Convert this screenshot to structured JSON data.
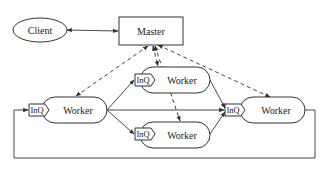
{
  "diagram": {
    "type": "master-worker architecture",
    "nodes": {
      "client": {
        "label": "Client"
      },
      "master": {
        "label": "Master"
      },
      "worker_left": {
        "label": "Worker",
        "queue": "InQ"
      },
      "worker_top": {
        "label": "Worker",
        "queue": "InQ"
      },
      "worker_bottom": {
        "label": "Worker",
        "queue": "InQ"
      },
      "worker_right": {
        "label": "Worker",
        "queue": "InQ"
      }
    },
    "edges": [
      {
        "from": "client",
        "to": "master",
        "style": "solid",
        "direction": "both"
      },
      {
        "from": "master",
        "to": "worker_left",
        "style": "dashed",
        "direction": "both"
      },
      {
        "from": "master",
        "to": "worker_top",
        "style": "dashed",
        "direction": "both"
      },
      {
        "from": "master",
        "to": "worker_bottom",
        "style": "dashed",
        "direction": "both"
      },
      {
        "from": "master",
        "to": "worker_right",
        "style": "dashed",
        "direction": "both"
      },
      {
        "from": "worker_left",
        "to": "worker_top",
        "style": "solid",
        "direction": "forward"
      },
      {
        "from": "worker_left",
        "to": "worker_bottom",
        "style": "solid",
        "direction": "forward"
      },
      {
        "from": "worker_left",
        "to": "worker_right",
        "style": "solid",
        "direction": "forward"
      },
      {
        "from": "worker_top",
        "to": "worker_right",
        "style": "solid",
        "direction": "forward"
      },
      {
        "from": "worker_bottom",
        "to": "worker_right",
        "style": "solid",
        "direction": "forward"
      },
      {
        "from": "worker_right",
        "to": "worker_left",
        "style": "solid",
        "direction": "forward",
        "routing": "loop-below"
      }
    ]
  }
}
